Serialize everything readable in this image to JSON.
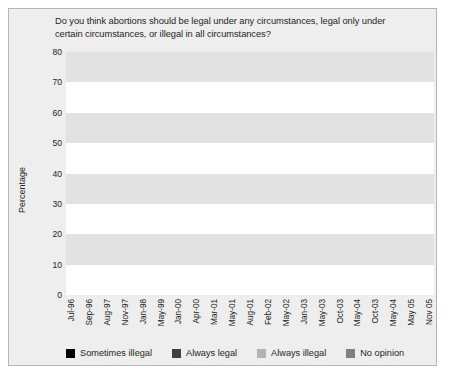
{
  "chart_data": {
    "type": "line",
    "title": "Do you think abortions should be legal under any circumstances, legal only under certain circumstances, or illegal in all circumstances?",
    "xlabel": "",
    "ylabel": "Percentage",
    "ylim": [
      0,
      80
    ],
    "yticks": [
      0,
      10,
      20,
      30,
      40,
      50,
      60,
      70,
      80
    ],
    "grid": "horizontal-banded",
    "legend_position": "bottom",
    "categories": [
      "Jul-96",
      "Sep-96",
      "Aug-97",
      "Nov-97",
      "Jan-98",
      "May-99",
      "Jan-00",
      "Apr-00",
      "Mar-01",
      "May-01",
      "Aug-01",
      "Feb-02",
      "May-02",
      "Jan-03",
      "May-03",
      "Oct-03",
      "May-04",
      "Oct-03",
      "May-04",
      "May 05",
      "Nov 05"
    ],
    "series": [
      {
        "name": "Sometimes illegal",
        "color": "#000000",
        "values": [
          59,
          55,
          63,
          57,
          60,
          56,
          61,
          54,
          58,
          53,
          60,
          52,
          57,
          56,
          56,
          54,
          57,
          52,
          57,
          53,
          56
        ]
      },
      {
        "name": "Always legal",
        "color": "#3f3f3f",
        "values": [
          26,
          26,
          24,
          27,
          25,
          29,
          27,
          26,
          27,
          26,
          26,
          25,
          24,
          25,
          26,
          25,
          24,
          23,
          28,
          24,
          26
        ]
      },
      {
        "name": "Always illegal",
        "color": "#b3b3b3",
        "values": [
          17,
          18,
          16,
          18,
          19,
          19,
          19,
          17,
          21,
          21,
          19,
          22,
          19,
          19,
          20,
          21,
          19,
          23,
          17,
          22,
          16
        ]
      },
      {
        "name": "No opinion",
        "color": "#808080",
        "values": [
          4,
          8,
          4,
          3,
          3,
          4,
          5,
          4,
          7,
          3,
          3,
          3,
          3,
          2,
          2,
          3,
          4,
          2,
          2,
          2,
          2
        ]
      }
    ]
  },
  "legend": [
    {
      "label": "Sometimes illegal",
      "color": "#000000"
    },
    {
      "label": "Always legal",
      "color": "#3f3f3f"
    },
    {
      "label": "Always illegal",
      "color": "#b3b3b3"
    },
    {
      "label": "No opinion",
      "color": "#808080"
    }
  ]
}
